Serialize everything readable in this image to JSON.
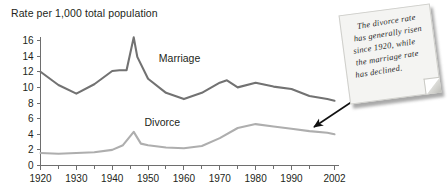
{
  "chart_data": {
    "type": "line",
    "title": "Rate per 1,000 total population",
    "xlabel": "",
    "ylabel": "",
    "xlim": [
      1920,
      2002
    ],
    "ylim": [
      0,
      16.8
    ],
    "grid": false,
    "legend_position": "inline-labels",
    "y_ticks": [
      "0",
      "2",
      "4",
      "6",
      "8",
      "10",
      "12",
      "14",
      "16"
    ],
    "y_tick_values": [
      0,
      2,
      4,
      6,
      8,
      10,
      12,
      14,
      16
    ],
    "x_ticks": [
      "1920",
      "1930",
      "1940",
      "1950",
      "1960",
      "1970",
      "1980",
      "1990",
      "2002"
    ],
    "x_tick_values": [
      1920,
      1930,
      1940,
      1950,
      1960,
      1970,
      1980,
      1990,
      2002
    ],
    "x_minor_tick_values": [
      1925,
      1935,
      1945,
      1955,
      1965,
      1975,
      1985,
      1995
    ],
    "series": [
      {
        "name": "Marriage",
        "color": "#727272",
        "label_x": 1953,
        "label_y": 13.2,
        "x": [
          1920,
          1925,
          1930,
          1935,
          1940,
          1942,
          1944,
          1946,
          1947,
          1950,
          1955,
          1960,
          1965,
          1970,
          1972,
          1975,
          1980,
          1985,
          1990,
          1995,
          2000,
          2002
        ],
        "values": [
          12.0,
          10.3,
          9.2,
          10.4,
          12.1,
          12.2,
          12.2,
          16.4,
          13.9,
          11.1,
          9.3,
          8.5,
          9.3,
          10.6,
          10.9,
          10.0,
          10.6,
          10.1,
          9.8,
          8.9,
          8.5,
          8.3
        ]
      },
      {
        "name": "Divorce",
        "color": "#aeaeae",
        "label_x": 1949,
        "label_y": 5.0,
        "x": [
          1920,
          1925,
          1930,
          1935,
          1940,
          1943,
          1946,
          1948,
          1950,
          1955,
          1960,
          1965,
          1970,
          1975,
          1980,
          1985,
          1990,
          1995,
          2000,
          2002
        ],
        "values": [
          1.6,
          1.5,
          1.6,
          1.7,
          2.0,
          2.6,
          4.3,
          2.8,
          2.6,
          2.3,
          2.2,
          2.5,
          3.5,
          4.8,
          5.3,
          5.0,
          4.7,
          4.4,
          4.2,
          4.0
        ]
      }
    ],
    "annotation": {
      "lines": [
        "The divorce rate",
        "has generally risen",
        "since 1920, while",
        "the marriage rate",
        "has declined."
      ],
      "text": "The divorce rate has generally risen since 1920, while the marriage rate has declined.",
      "points_to_series": "Divorce",
      "points_to_x": 2002
    }
  },
  "colors": {
    "background": "#ffffff",
    "axis": "#6e6e6e",
    "text": "#231f20",
    "marriage": "#727272",
    "divorce": "#aeaeae",
    "note_paper": "#f4f4f2",
    "arrow": "#111111"
  }
}
